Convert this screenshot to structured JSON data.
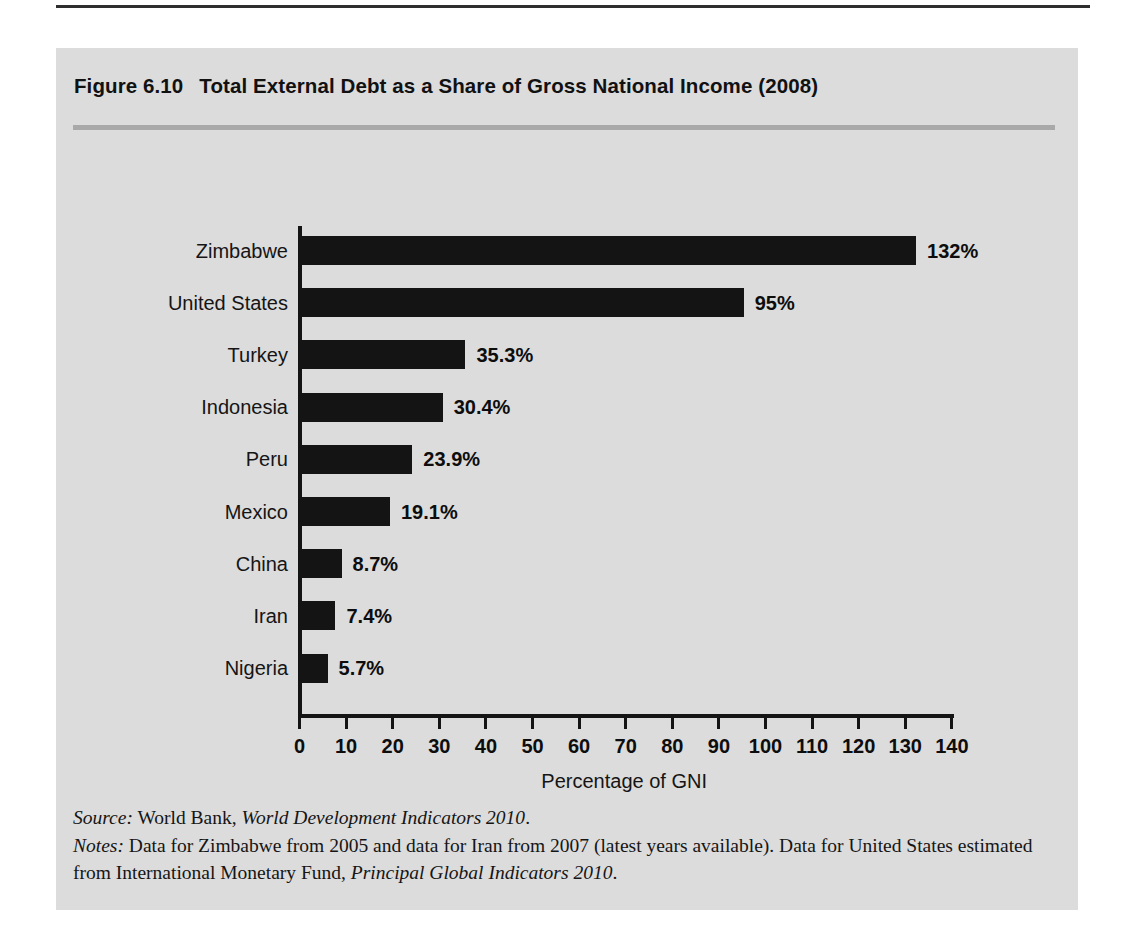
{
  "figure": {
    "number": "Figure 6.10",
    "title": "Total External Debt as a Share of Gross National Income (2008)"
  },
  "footnotes": {
    "source_lead": "Source:",
    "source_text": " World Bank, ",
    "source_italic": "World Development Indicators 2010",
    "source_end": ".",
    "notes_lead": "Notes:",
    "notes_text": " Data for Zimbabwe from 2005 and data for Iran from 2007 (latest years available). Data for United States estimated from International Monetary Fund, ",
    "notes_italic": "Principal Global Indicators 2010",
    "notes_end": "."
  },
  "colors": {
    "panel_background": "#dcdcdc",
    "bar": "#141414",
    "axis": "#141414",
    "title_rule": "#a9a9a9",
    "top_rule": "#2e2e2e",
    "text": "#151515"
  },
  "chart_data": {
    "type": "bar",
    "orientation": "horizontal",
    "title": "Total External Debt as a Share of Gross National Income (2008)",
    "xlabel": "Percentage of GNI",
    "ylabel": "",
    "xlim": [
      0,
      140
    ],
    "xticks": [
      0,
      10,
      20,
      30,
      40,
      50,
      60,
      70,
      80,
      90,
      100,
      110,
      120,
      130,
      140
    ],
    "xtick_labels": [
      "0",
      "10",
      "20",
      "30",
      "40",
      "50",
      "60",
      "70",
      "80",
      "90",
      "100",
      "110",
      "120",
      "130",
      "140"
    ],
    "grid": false,
    "legend": false,
    "categories": [
      "Zimbabwe",
      "United States",
      "Turkey",
      "Indonesia",
      "Peru",
      "Mexico",
      "China",
      "Iran",
      "Nigeria"
    ],
    "values": [
      132,
      95,
      35.3,
      30.4,
      23.9,
      19.1,
      8.7,
      7.4,
      5.7
    ],
    "data_labels": [
      "132%",
      "95%",
      "35.3%",
      "30.4%",
      "23.9%",
      "19.1%",
      "8.7%",
      "7.4%",
      "5.7%"
    ],
    "bars": [
      {
        "category": "Zimbabwe",
        "value": 132,
        "label": "132%"
      },
      {
        "category": "United States",
        "value": 95,
        "label": "95%"
      },
      {
        "category": "Turkey",
        "value": 35.3,
        "label": "35.3%"
      },
      {
        "category": "Indonesia",
        "value": 30.4,
        "label": "30.4%"
      },
      {
        "category": "Peru",
        "value": 23.9,
        "label": "23.9%"
      },
      {
        "category": "Mexico",
        "value": 19.1,
        "label": "19.1%"
      },
      {
        "category": "China",
        "value": 8.7,
        "label": "8.7%"
      },
      {
        "category": "Iran",
        "value": 7.4,
        "label": "7.4%"
      },
      {
        "category": "Nigeria",
        "value": 5.7,
        "label": "5.7%"
      }
    ]
  }
}
